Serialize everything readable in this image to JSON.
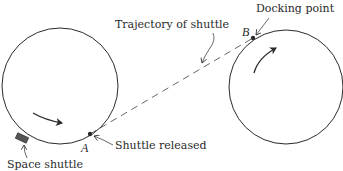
{
  "diagram": {
    "labels": {
      "trajectory": "Trajectory of shuttle",
      "docking_point": "Docking point",
      "shuttle_released": "Shuttle released",
      "space_shuttle": "Space shuttle",
      "point_a": "A",
      "point_b": "B"
    },
    "colors": {
      "stroke": "#2a2a2a",
      "background": "#ffffff"
    }
  }
}
